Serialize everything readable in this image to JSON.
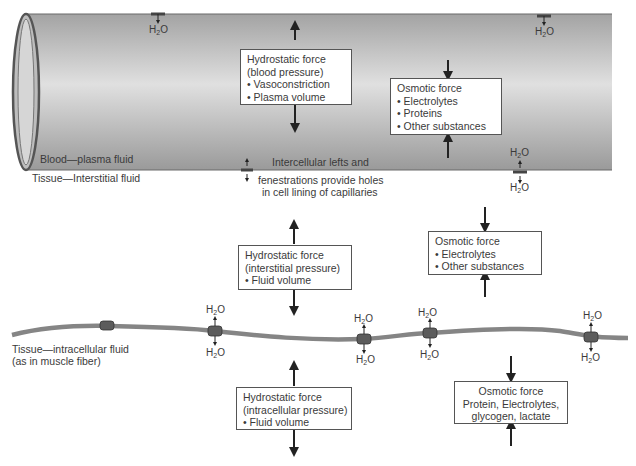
{
  "diagram": {
    "type": "fluid-exchange",
    "compartments": {
      "blood": "Blood—plasma fluid",
      "interstitial": "Tissue—Interstitial fluid",
      "intracellular_line1": "Tissue—intracellular fluid",
      "intracellular_line2": "(as in muscle fiber)"
    },
    "capillary_note": {
      "line1": "Intercellular lefts and",
      "line2": "fenestrations provide holes",
      "line3": "in cell lining of capillaries"
    },
    "water_label": "H",
    "water_sub": "2",
    "water_suffix": "O",
    "boxes": {
      "hydrostatic_blood": {
        "title": "Hydrostatic force",
        "subtitle": "(blood pressure)",
        "bullets": [
          "• Vasoconstriction",
          "• Plasma volume"
        ]
      },
      "osmotic_blood": {
        "title": "Osmotic force",
        "bullets": [
          "• Electrolytes",
          "• Proteins",
          "• Other substances"
        ]
      },
      "hydrostatic_interstitial": {
        "title": "Hydrostatic force",
        "subtitle": "(interstitial pressure)",
        "bullets": [
          "• Fluid volume"
        ]
      },
      "osmotic_interstitial": {
        "title": "Osmotic force",
        "bullets": [
          "• Electrolytes",
          "• Other substances"
        ]
      },
      "hydrostatic_intracellular": {
        "title": "Hydrostatic force",
        "subtitle": "(intracellular pressure)",
        "bullets": [
          "• Fluid volume"
        ]
      },
      "osmotic_intracellular": {
        "line1": "Osmotic force",
        "line2": "Protein, Electrolytes,",
        "line3": "glycogen, lactate"
      }
    },
    "colors": {
      "vessel_dark": "#9c9c9c",
      "vessel_light": "#e2e2e2",
      "membrane": "#7f7f7f",
      "channel": "#5a5a5a",
      "arrow": "#222222",
      "box_border": "#555555"
    }
  }
}
